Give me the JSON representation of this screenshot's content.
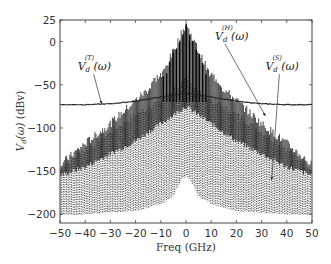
{
  "chart_data": {
    "type": "line",
    "title": "",
    "xlabel": "Freq (GHz)",
    "ylabel": "V_d(ω) (dBv)",
    "ylabel_parts": {
      "main": "V",
      "sub": "d",
      "arg": "(ω)",
      "unit": " (dBv)"
    },
    "xlim": [
      -50,
      50
    ],
    "ylim": [
      -210,
      25
    ],
    "xticks": [
      -50,
      -40,
      -30,
      -20,
      -10,
      0,
      10,
      20,
      30,
      40,
      50
    ],
    "xtick_labels": [
      "−50",
      "−40",
      "−30",
      "−20",
      "−10",
      "0",
      "10",
      "20",
      "30",
      "40",
      "50"
    ],
    "yticks": [
      25,
      0,
      -50,
      -100,
      -150,
      -200
    ],
    "ytick_labels": [
      "25",
      "0",
      "−50",
      "−100",
      "−150",
      "−200"
    ],
    "grid": false,
    "legend": "none (inline annotations)",
    "series": [
      {
        "name": "V_d^(T)(ω)",
        "label_sup": "(T)",
        "style": "solid thin line",
        "color": "#222222",
        "x": [
          -50,
          -40,
          -30,
          -20,
          -10,
          0,
          10,
          20,
          30,
          40,
          50
        ],
        "values": [
          -73,
          -73,
          -72,
          -69,
          -64,
          -60,
          -64,
          -69,
          -72,
          -73,
          -73
        ]
      },
      {
        "name": "V_d^(H)(ω)",
        "label_sup": "(H)",
        "style": "dense solid comb (envelope)",
        "color": "#111111",
        "x": [
          -50,
          -40,
          -30,
          -20,
          -10,
          0,
          10,
          20,
          30,
          40,
          50
        ],
        "envelope_top": [
          -143,
          -118,
          -95,
          -68,
          -42,
          20,
          -42,
          -68,
          -95,
          -118,
          -143
        ],
        "envelope_bottom": [
          -155,
          -145,
          -130,
          -115,
          -95,
          -75,
          -95,
          -115,
          -130,
          -145,
          -155
        ]
      },
      {
        "name": "V_d^(S)(ω)",
        "label_sup": "(S)",
        "style": "dotted comb",
        "color": "#555555",
        "x": [
          -50,
          -40,
          -30,
          -20,
          -10,
          0,
          10,
          20,
          30,
          40,
          50
        ],
        "envelope_top": [
          -148,
          -125,
          -105,
          -85,
          -68,
          -45,
          -68,
          -85,
          -105,
          -125,
          -148
        ],
        "envelope_bottom": [
          -201,
          -200,
          -198,
          -196,
          -188,
          -170,
          -188,
          -196,
          -198,
          -200,
          -201
        ]
      }
    ],
    "annotations": [
      {
        "id": "T",
        "text_main": "V",
        "text_sub": "d",
        "text_sup": "(T)",
        "text_arg": "(ω)",
        "text_x": -43,
        "text_y": -33,
        "arrow_to": [
          -33.5,
          -72
        ]
      },
      {
        "id": "H",
        "text_main": "V",
        "text_sub": "d",
        "text_sup": "(H)",
        "text_arg": "(ω)",
        "text_x": 11.5,
        "text_y": 2,
        "arrow_to": [
          31.5,
          -86
        ]
      },
      {
        "id": "S",
        "text_main": "V",
        "text_sub": "d",
        "text_sup": "(S)",
        "text_arg": "(ω)",
        "text_x": 31.5,
        "text_y": -33,
        "arrow_to": [
          34,
          -160
        ]
      }
    ],
    "comb_spacing_ghz": 1.3
  }
}
